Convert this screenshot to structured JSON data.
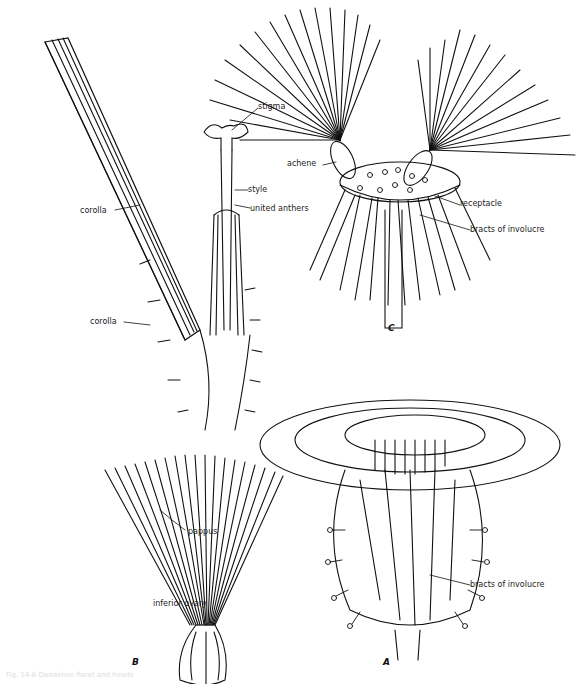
{
  "figure": {
    "panels": [
      {
        "id": "A",
        "label": "A",
        "subject": "flower head"
      },
      {
        "id": "B",
        "label": "B",
        "subject": "single floret"
      },
      {
        "id": "C",
        "label": "C",
        "subject": "fruiting head with achenes"
      }
    ],
    "labels": {
      "stigma": "stigma",
      "style": "style",
      "corolla_upper": "corolla",
      "united_anthers": "united anthers",
      "corolla_lower": "corolla",
      "pappus": "pappus",
      "inferior_ovary": "inferior ovary",
      "achene": "achene",
      "receptacle": "receptacle",
      "bracts_c": "bracts of involucre",
      "bracts_a": "bracts of involucre"
    },
    "caption": "Fig. 14-6  Dandelion floret and heads"
  }
}
